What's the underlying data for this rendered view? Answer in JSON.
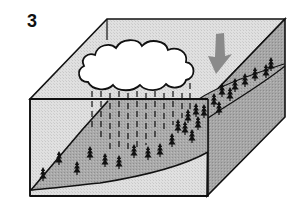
{
  "figure": {
    "panel_number": "3",
    "elements": {
      "cloud": "rain-cloud",
      "rain": "dashed rain streaks",
      "slope": "forested hillside",
      "arrow": "downward arrow",
      "block": "3d terrain block"
    }
  },
  "colors": {
    "outline": "#111111",
    "top_face": "#e2e2e2",
    "front_face_light": "#dcdcdc",
    "hill": "#a9a9a9",
    "right_face": "#a3a3a3",
    "arrow": "#8a8a8a",
    "cloud": "#ffffff",
    "tree": "#111111"
  }
}
